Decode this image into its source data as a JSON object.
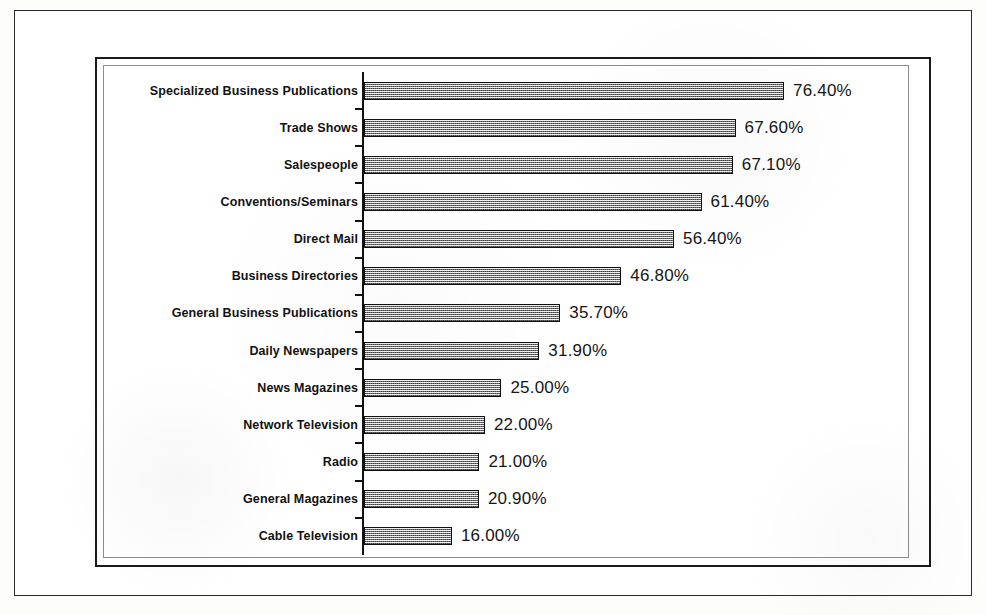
{
  "chart_data": {
    "type": "bar",
    "orientation": "horizontal",
    "title": "",
    "subtitle": "",
    "xlabel": "",
    "ylabel": "",
    "categories": [
      "Specialized Business Publications",
      "Trade Shows",
      "Salespeople",
      "Conventions/Seminars",
      "Direct Mail",
      "Business Directories",
      "General Business Publications",
      "Daily Newspapers",
      "News Magazines",
      "Network Television",
      "Radio",
      "General Magazines",
      "Cable Television"
    ],
    "values": [
      76.4,
      67.6,
      67.1,
      61.4,
      56.4,
      46.8,
      35.7,
      31.9,
      25.0,
      22.0,
      21.0,
      20.9,
      16.0
    ],
    "value_labels": [
      "76.40%",
      "67.60%",
      "67.10%",
      "61.40%",
      "56.40%",
      "46.80%",
      "35.70%",
      "31.90%",
      "25.00%",
      "22.00%",
      "21.00%",
      "20.90%",
      "16.00%"
    ],
    "xlim": [
      0,
      80
    ],
    "grid": false,
    "legend": null,
    "bar_fill": "#b9b9b9",
    "bar_border": "#101010",
    "axis_color": "#111111",
    "background": "#ffffff",
    "data_labels_shown": true,
    "tick_labels_x": []
  },
  "figure": {
    "outer_border_color": "#2a2a2a",
    "chart_frame_color": "#1a1a1a",
    "plot_frame_color": "#8d8d8d"
  }
}
